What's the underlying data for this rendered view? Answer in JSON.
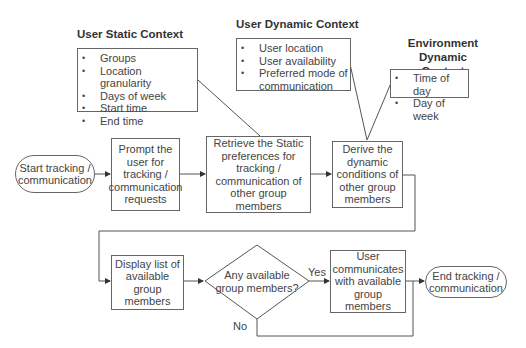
{
  "contexts": {
    "user_static": {
      "heading": "User Static Context",
      "items": [
        "Groups",
        "Location granularity",
        "Days of week",
        "Start time",
        "End time"
      ]
    },
    "user_dynamic": {
      "heading": "User Dynamic Context",
      "items": [
        "User location",
        "User availability",
        "Preferred mode of communication"
      ]
    },
    "environment_dynamic": {
      "heading_line1": "Environment Dynamic",
      "heading_line2": "Context",
      "items": [
        "Time of day",
        "Day of week"
      ]
    }
  },
  "nodes": {
    "start": "Start tracking / communication",
    "prompt": "Prompt the user for tracking / communication requests",
    "retrieve": "Retrieve the Static preferences for tracking / communication of other group members",
    "derive": "Derive the dynamic conditions of other group members",
    "display": "Display list of available group members",
    "decision": "Any available group members?",
    "communicate": "User communicates with available group members",
    "end": "End tracking / communication"
  },
  "edges": {
    "yes_label": "Yes",
    "no_label": "No"
  },
  "colors": {
    "line": "#555555",
    "text": "#444444",
    "background": "#ffffff"
  }
}
